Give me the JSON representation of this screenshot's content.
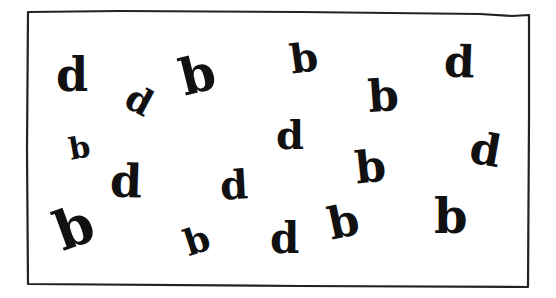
{
  "worksheet": {
    "border_color": "#222222",
    "ink_color": "#111111",
    "letters": [
      {
        "char": "d",
        "x": 56,
        "y": 52,
        "size": 46,
        "rotate": 0
      },
      {
        "char": "d",
        "x": 127,
        "y": 82,
        "size": 36,
        "rotate": 28
      },
      {
        "char": "b",
        "x": 180,
        "y": 50,
        "size": 50,
        "rotate": -14
      },
      {
        "char": "b",
        "x": 290,
        "y": 38,
        "size": 40,
        "rotate": -8
      },
      {
        "char": "b",
        "x": 368,
        "y": 74,
        "size": 44,
        "rotate": -4
      },
      {
        "char": "d",
        "x": 444,
        "y": 40,
        "size": 44,
        "rotate": 2
      },
      {
        "char": "b",
        "x": 69,
        "y": 133,
        "size": 30,
        "rotate": -10
      },
      {
        "char": "d",
        "x": 110,
        "y": 158,
        "size": 46,
        "rotate": 2
      },
      {
        "char": "d",
        "x": 220,
        "y": 165,
        "size": 40,
        "rotate": -3
      },
      {
        "char": "d",
        "x": 276,
        "y": 115,
        "size": 40,
        "rotate": 0
      },
      {
        "char": "b",
        "x": 355,
        "y": 145,
        "size": 44,
        "rotate": -6
      },
      {
        "char": "d",
        "x": 470,
        "y": 128,
        "size": 44,
        "rotate": 10
      },
      {
        "char": "b",
        "x": 55,
        "y": 200,
        "size": 54,
        "rotate": -20
      },
      {
        "char": "b",
        "x": 184,
        "y": 222,
        "size": 36,
        "rotate": -18
      },
      {
        "char": "d",
        "x": 270,
        "y": 218,
        "size": 42,
        "rotate": 0
      },
      {
        "char": "b",
        "x": 328,
        "y": 200,
        "size": 44,
        "rotate": -12
      },
      {
        "char": "b",
        "x": 434,
        "y": 192,
        "size": 48,
        "rotate": 0
      }
    ]
  }
}
